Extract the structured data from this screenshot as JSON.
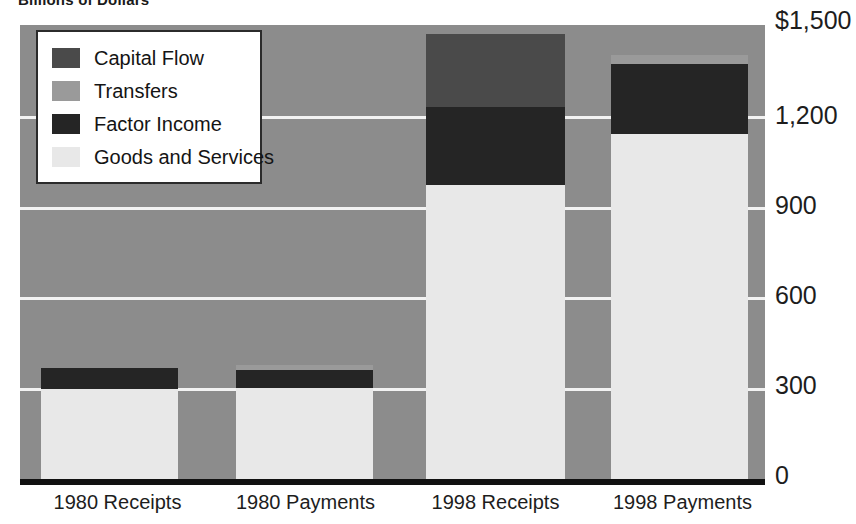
{
  "subtitle": "Billions of Dollars",
  "legend": {
    "items": [
      {
        "label": "Capital Flow",
        "color": "#4a4a4a"
      },
      {
        "label": "Transfers",
        "color": "#9a9a9a"
      },
      {
        "label": "Factor Income",
        "color": "#252525"
      },
      {
        "label": "Goods and Services",
        "color": "#e8e8e8"
      }
    ]
  },
  "colors": {
    "plot_background": "#8c8c8c",
    "gridline": "#f2f2f2",
    "axis": "#111111",
    "capital_flow": "#4a4a4a",
    "transfers": "#9a9a9a",
    "factor_income": "#252525",
    "goods_and_services": "#e8e8e8"
  },
  "chart_data": {
    "type": "bar",
    "title": "",
    "subtitle": "Billions of Dollars",
    "stacked": true,
    "xlabel": "",
    "ylabel": "Billions of Dollars",
    "categories": [
      "1980 Receipts",
      "1980 Payments",
      "1998 Receipts",
      "1998 Payments"
    ],
    "ylim": [
      0,
      1500
    ],
    "yticks": [
      0,
      300,
      600,
      900,
      1200,
      1500
    ],
    "ytick_labels": [
      "0",
      "300",
      "600",
      "900",
      "1,200",
      "$1,500"
    ],
    "grid": true,
    "legend_position": "top-left",
    "series": [
      {
        "name": "Goods and Services",
        "color": "#e8e8e8",
        "values": [
          297,
          300,
          970,
          1140
        ]
      },
      {
        "name": "Factor Income",
        "color": "#252525",
        "values": [
          70,
          60,
          260,
          230
        ]
      },
      {
        "name": "Transfers",
        "color": "#9a9a9a",
        "values": [
          0,
          17,
          0,
          30
        ]
      },
      {
        "name": "Capital Flow",
        "color": "#4a4a4a",
        "values": [
          0,
          0,
          240,
          0
        ]
      }
    ],
    "totals": [
      367,
      377,
      1470,
      1400
    ]
  },
  "yaxis": {
    "ticks": [
      {
        "label": "$1,500",
        "value": 1500
      },
      {
        "label": "1,200",
        "value": 1200
      },
      {
        "label": "900",
        "value": 900
      },
      {
        "label": "600",
        "value": 600
      },
      {
        "label": "300",
        "value": 300
      },
      {
        "label": "0",
        "value": 0
      }
    ]
  },
  "xaxis": {
    "labels": [
      "1980 Receipts",
      "1980 Payments",
      "1998 Receipts",
      "1998 Payments"
    ]
  }
}
